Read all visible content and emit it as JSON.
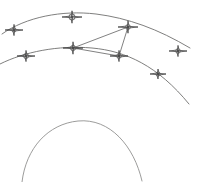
{
  "canvas": {
    "width": 198,
    "height": 182,
    "background": "#ffffff",
    "title": "Survey Arc Diagram"
  },
  "style": {
    "arc_stroke": "#70706f",
    "arc_stroke_soft": "#8a8a89",
    "traverse_stroke": "#6a6a6a",
    "marker_stroke": "#4a4a4a",
    "marker_core": "#3d3d3d",
    "arc_stroke_width": 0.9,
    "traverse_stroke_width": 0.85,
    "marker_stroke_width": 0.85
  },
  "chart_data": {
    "type": "scatter",
    "xlabel": "",
    "ylabel": "",
    "xlim": [
      0,
      198
    ],
    "ylim": [
      0,
      182
    ],
    "grid": false,
    "legend": "none",
    "arcs": [
      {
        "name": "upper-arc",
        "path": "M 2 34 C 26 17, 62 10, 96 14 C 128 18, 158 29, 190 48",
        "stroke": "#70706f",
        "has_markers": true
      },
      {
        "name": "middle-arc",
        "path": "M 0 64 C 24 52, 58 45, 92 48 C 126 51, 158 66, 189 104",
        "stroke": "#70706f",
        "has_markers": true
      },
      {
        "name": "lower-arc",
        "path": "M 22 182 C 26 148, 48 124, 78 121 C 110 118, 134 146, 142 181",
        "stroke": "#8a8a89",
        "has_markers": false
      }
    ],
    "markers": [
      {
        "id": "m1",
        "label": "station-1",
        "x": 14,
        "y": 30,
        "arc": "upper-arc",
        "size": 9,
        "ring": 2.1
      },
      {
        "id": "m2",
        "label": "station-2",
        "x": 72,
        "y": 17,
        "arc": "upper-arc",
        "size": 10,
        "ring": 3.1
      },
      {
        "id": "m3",
        "label": "station-3",
        "x": 128,
        "y": 27,
        "arc": "upper-arc",
        "size": 10,
        "ring": 2.4
      },
      {
        "id": "m4",
        "label": "station-4",
        "x": 178,
        "y": 51,
        "arc": "upper-arc",
        "size": 9,
        "ring": 2.3
      },
      {
        "id": "m5",
        "label": "station-5",
        "x": 26,
        "y": 56,
        "arc": "middle-arc",
        "size": 9,
        "ring": 2.5
      },
      {
        "id": "m6",
        "label": "station-6",
        "x": 73,
        "y": 48,
        "arc": "middle-arc",
        "size": 10,
        "ring": 2.6
      },
      {
        "id": "m7",
        "label": "station-7",
        "x": 119,
        "y": 56,
        "arc": "middle-arc",
        "size": 9,
        "ring": 2.3
      },
      {
        "id": "m8",
        "label": "station-8",
        "x": 158,
        "y": 74,
        "arc": "middle-arc",
        "size": 8,
        "ring": 2.1
      }
    ],
    "traverse_lines": [
      {
        "id": "t1",
        "label": "traverse-6-to-3",
        "from": "m6",
        "to": "m3",
        "x1": 73,
        "y1": 48,
        "x2": 128,
        "y2": 27
      },
      {
        "id": "t2",
        "label": "traverse-3-to-7",
        "from": "m3",
        "to": "m7",
        "x1": 128,
        "y1": 27,
        "x2": 119,
        "y2": 56
      },
      {
        "id": "t3",
        "label": "traverse-7-to-6",
        "from": "m7",
        "to": "m6",
        "x1": 119,
        "y1": 56,
        "x2": 73,
        "y2": 48
      }
    ]
  }
}
